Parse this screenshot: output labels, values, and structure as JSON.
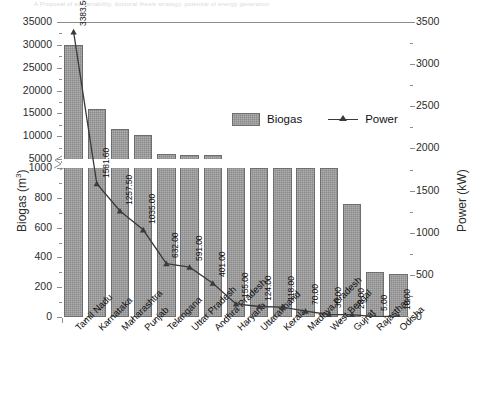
{
  "top_fragment": "A Proposal of sustainability, doctoral thesis strategy, potential of energy generation",
  "axes": {
    "left_title_main": "Biogas (m",
    "left_title_sup": "3",
    "left_title_end": ")",
    "right_title": "Power (kW)",
    "left_ticks_upper": [
      "35000",
      "30000",
      "25000",
      "20000",
      "15000",
      "10000",
      "5000"
    ],
    "left_ticks_lower": [
      "1000",
      "800",
      "600",
      "400",
      "200",
      "0"
    ],
    "right_ticks": [
      "3500",
      "3000",
      "2500",
      "2000",
      "1500",
      "1000",
      "500",
      "0"
    ]
  },
  "legend": {
    "bar_label": "Biogas",
    "line_label": "Power"
  },
  "chart_data": {
    "type": "bar",
    "title": "",
    "xlabel": "",
    "ylabel": "Biogas (m3)",
    "y2label": "Power (kW)",
    "grid": false,
    "legend_position": "inside-top-center",
    "ylim_lower_segment": [
      0,
      1000
    ],
    "ylim_upper_segment": [
      5000,
      35000
    ],
    "y2lim": [
      0,
      3500
    ],
    "axis_break": true,
    "categories": [
      "Tamil Nadu",
      "Karnataka",
      "Maharashtra",
      "Punjab",
      "Telangana",
      "Uttar Pradesh",
      "Andhra Pradesh",
      "Haryana",
      "Uttarakhand",
      "Kerala",
      "Madhya Pradesh",
      "West Bengal",
      "Gujrat",
      "Rajasthan",
      "Odisha"
    ],
    "series": [
      {
        "name": "Biogas",
        "unit": "m3",
        "type": "bar",
        "values": [
          30000,
          16000,
          11500,
          10300,
          6200,
          5800,
          5800,
          4000,
          1000,
          1000,
          1000,
          1000,
          760,
          300,
          290
        ]
      },
      {
        "name": "Power",
        "unit": "kW",
        "type": "line",
        "marker": "triangle",
        "values": [
          3383.5,
          1581.6,
          1257.5,
          1035.0,
          632.0,
          591.0,
          401.0,
          155.0,
          124.0,
          118.0,
          70.0,
          30.0,
          28.0,
          5.0,
          10.0
        ],
        "data_labels": [
          "3383.50",
          "1581.60",
          "1257.50",
          "1035.00",
          "632.00",
          "591.00",
          "401.00",
          "155.00",
          "124.00",
          "118.00",
          "70.00",
          "30.00",
          "28.00",
          "5.00",
          "10.00"
        ]
      }
    ]
  }
}
